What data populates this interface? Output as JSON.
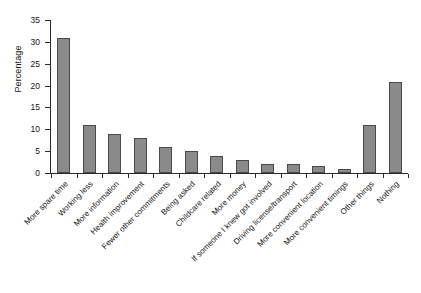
{
  "chart_data": {
    "type": "bar",
    "title": "",
    "xlabel": "",
    "ylabel": "Percentage",
    "ylim": [
      0,
      35
    ],
    "yticks": [
      0,
      5,
      10,
      15,
      20,
      25,
      30,
      35
    ],
    "grid": false,
    "legend": false,
    "bar_color": "#8a8a8a",
    "bar_edge_color": "#4a4a4a",
    "background": "#ffffff",
    "categories": [
      "More spare time",
      "Working less",
      "More information",
      "Health improvement",
      "Fewer other commitments",
      "Being asked",
      "Childcare related",
      "More money",
      "If someone I knew got involved",
      "Driving license/transport",
      "More convenient location",
      "More convenient timings",
      "Other things",
      "Nothing"
    ],
    "values": [
      30.8,
      11,
      9,
      8,
      6,
      5,
      4,
      3,
      2,
      2,
      1.6,
      1,
      11,
      20.8
    ]
  }
}
